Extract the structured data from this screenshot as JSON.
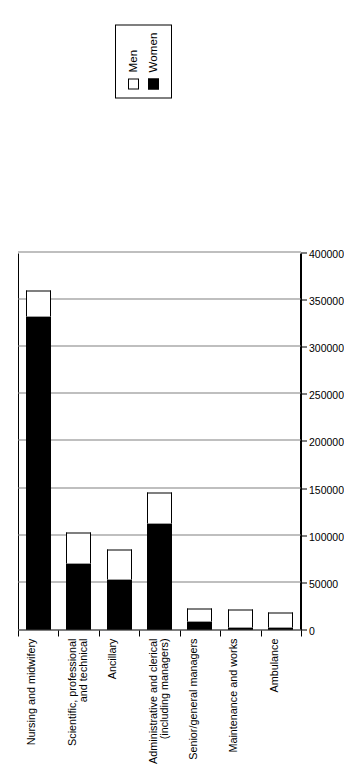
{
  "chart_data": {
    "type": "bar",
    "subtype": "stacked-horizontal",
    "orientation": "rotated-90-ccw",
    "title": "",
    "subtitle": "",
    "xlabel": "",
    "ylabel": "",
    "categories": [
      "Ambulance",
      "Maintenance and works",
      "Senior/general managers",
      "Administrative and clerical\n(including managers)",
      "Ancillary",
      "Scientific, professional\nand technical",
      "Nursing and midwifery"
    ],
    "series": [
      {
        "name": "Women",
        "color": "#000000",
        "values": [
          2000,
          1000,
          8000,
          112000,
          53000,
          70000,
          332000
        ]
      },
      {
        "name": "Men",
        "color": "#ffffff",
        "values": [
          16000,
          20000,
          14000,
          33000,
          32000,
          33000,
          28000
        ]
      }
    ],
    "totals": [
      18000,
      21000,
      22000,
      145000,
      85000,
      103000,
      360000
    ],
    "value_axis": {
      "min": 0,
      "max": 400000,
      "step": 50000,
      "ticks": [
        0,
        50000,
        100000,
        150000,
        200000,
        250000,
        300000,
        350000,
        400000
      ],
      "tick_labels": [
        "0",
        "50000",
        "100000",
        "150000",
        "200000",
        "250000",
        "300000",
        "350000",
        "400000"
      ]
    },
    "grid": true,
    "grid_color": "#808080",
    "legend": {
      "position": "top",
      "entries": [
        {
          "label": "Men",
          "swatch": "open-square",
          "color": "#ffffff"
        },
        {
          "label": "Women",
          "swatch": "filled-square",
          "color": "#000000"
        }
      ]
    }
  }
}
